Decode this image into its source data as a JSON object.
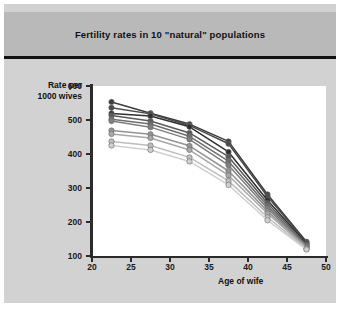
{
  "chart_data": {
    "type": "line",
    "title": "Fertility rates in 10 \"natural\" populations",
    "xlabel": "Age of wife",
    "ylabel": "Rate per 1000 wives",
    "ylabel_line1": "Rate per",
    "ylabel_line2": "1000 wives",
    "x": [
      22.5,
      27.5,
      32.5,
      37.5,
      42.5,
      47.5
    ],
    "xlim": [
      20,
      50
    ],
    "ylim": [
      100,
      600
    ],
    "xticks": [
      20,
      25,
      30,
      35,
      40,
      45,
      50
    ],
    "yticks": [
      100,
      200,
      300,
      400,
      500,
      600
    ],
    "grid": false,
    "legend": "none",
    "markers": "filled circles",
    "series": [
      {
        "name": "Population 1",
        "color": "#3d3d3d",
        "values": [
          553,
          520,
          488,
          437,
          281,
          142
        ]
      },
      {
        "name": "Population 2",
        "color": "#4a4a4a",
        "values": [
          536,
          518,
          484,
          430,
          275,
          139
        ]
      },
      {
        "name": "Population 3",
        "color": "#2f2f2f",
        "values": [
          519,
          512,
          480,
          406,
          264,
          136
        ]
      },
      {
        "name": "Population 4",
        "color": "#5a5a5a",
        "values": [
          513,
          497,
          462,
          392,
          255,
          133
        ]
      },
      {
        "name": "Population 5",
        "color": "#6e6e6e",
        "values": [
          502,
          488,
          452,
          379,
          247,
          130
        ]
      },
      {
        "name": "Population 6",
        "color": "#7f7f7f",
        "values": [
          497,
          479,
          443,
          367,
          240,
          128
        ]
      },
      {
        "name": "Population 7",
        "color": "#949494",
        "values": [
          469,
          458,
          424,
          350,
          232,
          126
        ]
      },
      {
        "name": "Population 8",
        "color": "#a8a8a8",
        "values": [
          459,
          447,
          412,
          337,
          225,
          124
        ]
      },
      {
        "name": "Population 9",
        "color": "#bdbdbd",
        "values": [
          437,
          425,
          390,
          321,
          214,
          121
        ]
      },
      {
        "name": "Population 10",
        "color": "#cfcfcf",
        "values": [
          425,
          412,
          378,
          309,
          205,
          119
        ]
      }
    ]
  }
}
